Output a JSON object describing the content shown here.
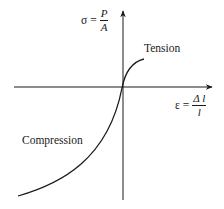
{
  "diagram": {
    "y_axis": {
      "symbol": "σ",
      "equals": "=",
      "numerator": "P",
      "denominator": "A"
    },
    "x_axis": {
      "symbol": "ε",
      "equals": "=",
      "numerator": "Δ l",
      "denominator": "l"
    },
    "labels": {
      "tension": "Tension",
      "compression": "Compression"
    },
    "colors": {
      "line": "#1a1a1a",
      "background": "#ffffff"
    }
  }
}
